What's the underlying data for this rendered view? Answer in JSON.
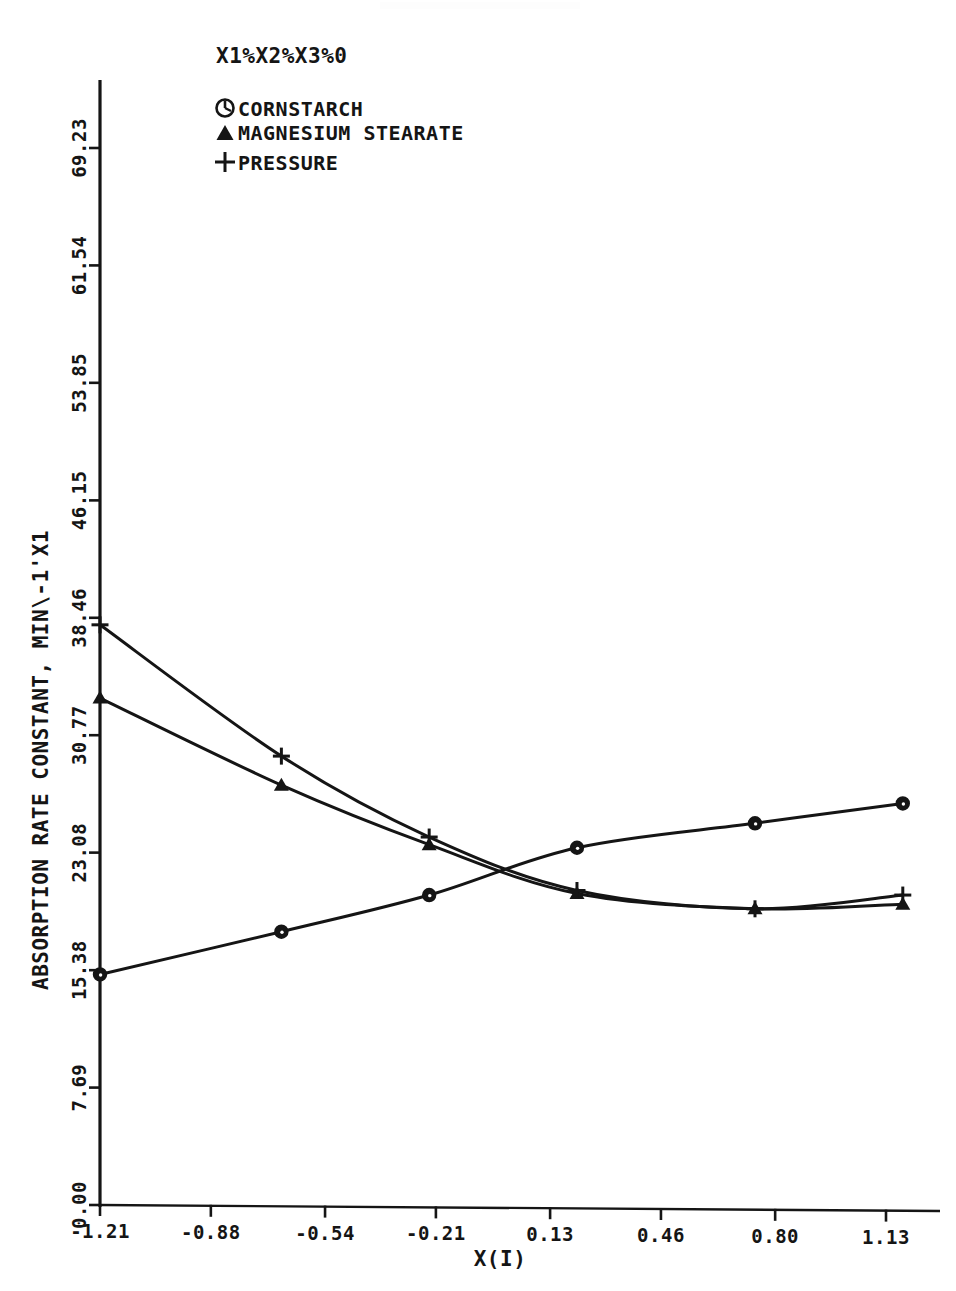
{
  "chart_data": {
    "type": "line",
    "title": "",
    "xlabel": "X(I)",
    "ylabel": "ABSORPTION RATE CONSTANT, MIN\\-1'X1",
    "legend_header": "X1%X2%X3%0",
    "legend_position": "top-left-inside",
    "grid": false,
    "xlim": [
      -1.21,
      1.13
    ],
    "ylim": [
      0.0,
      69.23
    ],
    "xticks": [
      -1.21,
      -0.88,
      -0.54,
      -0.21,
      0.13,
      0.46,
      0.8,
      1.13
    ],
    "xtick_labels": [
      "-1.21",
      "-0.88",
      "-0.54",
      "-0.21",
      "0.13",
      "0.46",
      "0.80",
      "1.13"
    ],
    "yticks": [
      0.0,
      7.69,
      15.38,
      23.08,
      30.77,
      38.46,
      46.15,
      53.85,
      61.54,
      69.23
    ],
    "ytick_labels": [
      "0.00",
      "7.69",
      "15.38",
      "23.08",
      "30.77",
      "38.46",
      "46.15",
      "53.85",
      "61.54",
      "69.23"
    ],
    "x": [
      -1.21,
      -0.67,
      -0.23,
      0.21,
      0.74,
      1.18
    ],
    "series": [
      {
        "name": "CORNSTARCH",
        "marker": "circle",
        "values": [
          15.1,
          17.9,
          20.3,
          23.4,
          25.0,
          26.3
        ]
      },
      {
        "name": "MAGNESIUM STEARATE",
        "marker": "triangle",
        "values": [
          33.2,
          27.5,
          23.6,
          20.4,
          19.4,
          19.7
        ]
      },
      {
        "name": "PRESSURE",
        "marker": "plus",
        "values": [
          38.0,
          29.4,
          24.1,
          20.6,
          19.4,
          20.3
        ]
      }
    ]
  },
  "legend": {
    "header": "X1%X2%X3%0",
    "entries": [
      {
        "marker": "circle-marker-icon",
        "label": "CORNSTARCH"
      },
      {
        "marker": "triangle-marker-icon",
        "label": "MAGNESIUM STEARATE"
      },
      {
        "marker": "plus-marker-icon",
        "label": "PRESSURE"
      }
    ]
  },
  "axes": {
    "x_title": "X(I)",
    "y_title": "ABSORPTION RATE CONSTANT, MIN\\-1'X1"
  },
  "colors": {
    "ink": "#151515",
    "background": "#ffffff"
  }
}
